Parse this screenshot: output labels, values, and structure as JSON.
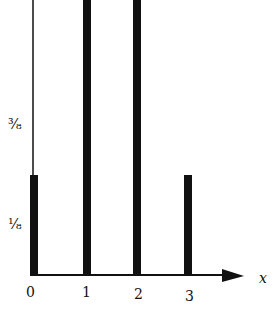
{
  "chart_data": {
    "type": "bar",
    "title": "",
    "xlabel": "x",
    "ylabel": "",
    "categories": [
      "0",
      "1",
      "2",
      "3"
    ],
    "values": [
      0.125,
      0.375,
      0.375,
      0.125
    ],
    "value_labels": [
      "1/8",
      "3/8",
      "3/8",
      "1/8"
    ],
    "yticks": [
      "1/8",
      "3/8"
    ],
    "ylim": [
      0,
      0.625
    ],
    "grid": false,
    "legend": "none"
  },
  "axis": {
    "x_symbol": "x",
    "xtick_labels": [
      "0",
      "1",
      "2",
      "3"
    ],
    "ytick_labels": [
      "¹⁄₈",
      "³⁄₈"
    ]
  },
  "colors": {
    "bar": "#111111",
    "axis": "#111111",
    "background": "#ffffff"
  }
}
